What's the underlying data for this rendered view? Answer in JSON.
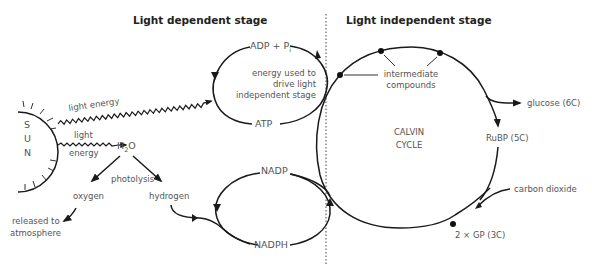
{
  "titles": {
    "left": "Light dependent stage",
    "right": "Light independent stage"
  },
  "sun": {
    "letters": [
      "S",
      "U",
      "N"
    ]
  },
  "light_dependent": {
    "light_energy_top": "light energy",
    "light_energy_bottom_1": "light",
    "light_energy_bottom_2": "energy",
    "water": "H",
    "water_sub": "2",
    "water_tail": "O",
    "photolysis": "photolysis",
    "oxygen": "oxygen",
    "hydrogen": "hydrogen",
    "released_1": "released to",
    "released_2": "atmosphere",
    "adp": "ADP + P",
    "adp_sub": "i",
    "atp": "ATP",
    "energy_note_1": "energy used to",
    "energy_note_2": "drive light",
    "energy_note_3": "independent stage",
    "nadp": "NADP",
    "nadph": "NADPH"
  },
  "light_independent": {
    "intermediate_1": "intermediate",
    "intermediate_2": "compounds",
    "calvin_1": "CALVIN",
    "calvin_2": "CYCLE",
    "glucose": "glucose (6C)",
    "rubp": "RuBP (5C)",
    "co2": "carbon dioxide",
    "gp": "2 × GP (3C)"
  },
  "colors": {
    "line": "#1a1a1a",
    "text": "#555555",
    "title": "#222222"
  }
}
